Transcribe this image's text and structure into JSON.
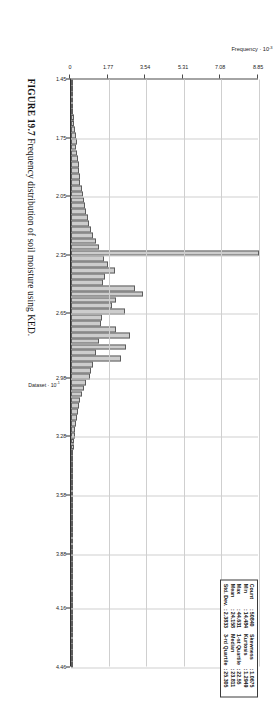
{
  "figure": {
    "caption_number": "FIGURE 19.7",
    "caption_text": "Frequency distribution of soil moisture using KED."
  },
  "stats_box": {
    "rows": [
      {
        "label": "Count",
        "sep": ":",
        "value": "50840",
        "label2": "Skewness",
        "sep2": ":",
        "value2": "1.0675"
      },
      {
        "label": "Min",
        "sep": ":",
        "value": "14.484",
        "label2": "Kurtosis",
        "sep2": ":",
        "value2": "1.2949"
      },
      {
        "label": "Max",
        "sep": ":",
        "value": "44.631",
        "label2": "1-st Quartile",
        "sep2": ":",
        "value2": "22.55"
      },
      {
        "label": "Mean",
        "sep": ":",
        "value": "24.158",
        "label2": "Median",
        "sep2": ":",
        "value2": "23.811"
      },
      {
        "label": "Std. Dev.",
        "sep": ":",
        "value": "2.3833",
        "label2": "3-rd Quartile",
        "sep2": ":",
        "value2": "25.305"
      }
    ]
  },
  "chart_data": {
    "type": "bar",
    "title": "",
    "subtitle": "",
    "xlabel": "Dataset · 10⁻¹",
    "xlabel_base": "Dataset · 10",
    "xlabel_exp": "-1",
    "ylabel": "Frequency · 10⁻³",
    "ylabel_base": "Frequency · 10",
    "ylabel_exp": "-3",
    "xlim": [
      1.45,
      4.46
    ],
    "ylim": [
      0,
      8.85
    ],
    "grid": true,
    "legend": "none",
    "xticks": [
      "1.45",
      "1.75",
      "2.05",
      "2.35",
      "2.65",
      "2.98",
      "3.28",
      "3.58",
      "3.88",
      "4.16",
      "4.46"
    ],
    "xtick_values": [
      1.45,
      1.75,
      2.05,
      2.35,
      2.65,
      2.98,
      3.28,
      3.58,
      3.88,
      4.16,
      4.46
    ],
    "yticks": [
      "0",
      "1.77",
      "3.54",
      "5.31",
      "7.08",
      "8.85"
    ],
    "ytick_values": [
      0,
      1.77,
      3.54,
      5.31,
      7.08,
      8.85
    ],
    "bar_color": "#cdcdcd",
    "bar_edge_color": "#5d5d5d",
    "grid_color": "#cfcfcf",
    "axis_color": "#2e2e2e",
    "bin_width": 0.0301,
    "x": [
      1.465,
      1.495,
      1.525,
      1.555,
      1.585,
      1.615,
      1.645,
      1.675,
      1.705,
      1.735,
      1.765,
      1.795,
      1.825,
      1.855,
      1.885,
      1.915,
      1.945,
      1.975,
      2.005,
      2.035,
      2.065,
      2.095,
      2.125,
      2.155,
      2.185,
      2.215,
      2.245,
      2.275,
      2.305,
      2.335,
      2.365,
      2.395,
      2.425,
      2.455,
      2.485,
      2.515,
      2.545,
      2.575,
      2.605,
      2.635,
      2.665,
      2.695,
      2.725,
      2.755,
      2.785,
      2.815,
      2.845,
      2.875,
      2.905,
      2.935,
      2.965,
      2.995,
      3.025,
      3.055,
      3.085,
      3.115,
      3.145,
      3.175,
      3.205,
      3.235,
      3.265,
      3.295,
      3.325,
      3.355,
      3.385,
      3.415,
      3.445,
      3.475,
      3.505,
      3.535,
      3.565,
      3.595,
      3.625,
      3.655,
      3.685,
      3.715,
      3.745,
      3.775,
      3.805,
      3.835,
      3.865,
      3.895,
      3.925,
      3.955,
      3.985,
      4.015,
      4.045,
      4.075,
      4.105,
      4.135,
      4.165,
      4.195,
      4.225,
      4.255,
      4.285,
      4.315,
      4.345,
      4.375,
      4.405,
      4.435
    ],
    "values": [
      0.02,
      0.03,
      0.05,
      0.06,
      0.08,
      0.1,
      0.13,
      0.16,
      0.19,
      0.22,
      0.26,
      0.24,
      0.3,
      0.33,
      0.36,
      0.4,
      0.44,
      0.42,
      0.5,
      0.55,
      0.6,
      0.64,
      0.7,
      0.78,
      0.86,
      0.95,
      1.05,
      1.18,
      1.3,
      8.85,
      1.55,
      1.72,
      2.05,
      1.6,
      1.52,
      3.02,
      3.4,
      2.1,
      1.95,
      2.55,
      1.45,
      1.4,
      2.1,
      2.78,
      1.3,
      2.6,
      1.2,
      2.35,
      1.05,
      0.95,
      0.88,
      0.72,
      0.6,
      0.54,
      0.44,
      0.38,
      0.32,
      0.27,
      0.23,
      0.2,
      0.17,
      0.15,
      0.13,
      0.11,
      0.1,
      0.09,
      0.08,
      0.07,
      0.06,
      0.055,
      0.05,
      0.045,
      0.04,
      0.038,
      0.034,
      0.03,
      0.028,
      0.025,
      0.022,
      0.02,
      0.05,
      0.018,
      0.016,
      0.014,
      0.013,
      0.012,
      0.011,
      0.01,
      0.009,
      0.008,
      0.007,
      0.006,
      0.006,
      0.005,
      0.005,
      0.004,
      0.004,
      0.003,
      0.003,
      0.003
    ]
  }
}
